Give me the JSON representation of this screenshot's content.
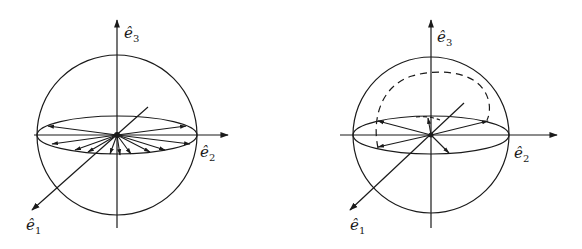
{
  "figure": {
    "panels": [
      {
        "id": "left",
        "description": "Unit sphere with equatorial ellipse; many arrows radiating from origin to points on the equator",
        "axes": {
          "e1": {
            "label": "ê",
            "sub": "1"
          },
          "e2": {
            "label": "ê",
            "sub": "2"
          },
          "e3": {
            "label": "ê",
            "sub": "3"
          }
        }
      },
      {
        "id": "right",
        "description": "Unit sphere with equatorial ellipse, dashed arc above, a few arrows from origin to the equator",
        "axes": {
          "e1": {
            "label": "ê",
            "sub": "1"
          },
          "e2": {
            "label": "ê",
            "sub": "2"
          },
          "e3": {
            "label": "ê",
            "sub": "3"
          }
        }
      }
    ],
    "colors": {
      "stroke": "#1a1a1a",
      "background": "#ffffff"
    }
  }
}
